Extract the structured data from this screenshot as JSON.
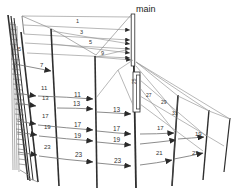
{
  "diagram": {
    "title_label": "main",
    "kind": "uml-sequence-diagram-fisheye",
    "background_color": "#ffffff",
    "line_color": "#3c3c3c",
    "thin_line_color": "#8a8a8a",
    "label_color": "#333333"
  },
  "root_lifeline": {
    "name": "main",
    "label": "main",
    "x_top": 131,
    "y_top": 14
  },
  "messages": [
    {
      "id": "m1",
      "label": "1",
      "x": 76,
      "y": 23
    },
    {
      "id": "m3",
      "label": "3",
      "x": 80,
      "y": 33
    },
    {
      "id": "m5",
      "label": "5",
      "x": 89,
      "y": 43
    },
    {
      "id": "m5b",
      "label": "5",
      "x": 19,
      "y": 50
    },
    {
      "id": "m7",
      "label": "7",
      "x": 41,
      "y": 68
    },
    {
      "id": "m9",
      "label": "9",
      "x": 101,
      "y": 54
    },
    {
      "id": "m11",
      "label": "11",
      "x": 44,
      "y": 90
    },
    {
      "id": "m11b",
      "label": "11",
      "x": 78,
      "y": 96
    },
    {
      "id": "m13",
      "label": "13",
      "x": 46,
      "y": 100
    },
    {
      "id": "m13b",
      "label": "13",
      "x": 76,
      "y": 107
    },
    {
      "id": "m13c",
      "label": "13",
      "x": 118,
      "y": 112
    },
    {
      "id": "m17",
      "label": "17",
      "x": 45,
      "y": 118
    },
    {
      "id": "m17b",
      "label": "17",
      "x": 78,
      "y": 128
    },
    {
      "id": "m17c",
      "label": "17",
      "x": 117,
      "y": 132
    },
    {
      "id": "m17d",
      "label": "17",
      "x": 161,
      "y": 131
    },
    {
      "id": "m19",
      "label": "19",
      "x": 47,
      "y": 130
    },
    {
      "id": "m19b",
      "label": "19",
      "x": 78,
      "y": 139
    },
    {
      "id": "m19c",
      "label": "19",
      "x": 117,
      "y": 143
    },
    {
      "id": "m19d",
      "label": "19",
      "x": 199,
      "y": 136
    },
    {
      "id": "m21",
      "label": "21",
      "x": 160,
      "y": 155
    },
    {
      "id": "m23",
      "label": "23",
      "x": 47,
      "y": 150
    },
    {
      "id": "m23b",
      "label": "23",
      "x": 79,
      "y": 157
    },
    {
      "id": "m23c",
      "label": "23",
      "x": 118,
      "y": 163
    },
    {
      "id": "m23d",
      "label": "23",
      "x": 196,
      "y": 155
    },
    {
      "id": "m25",
      "label": "25",
      "x": 138,
      "y": 84
    },
    {
      "id": "m27",
      "label": "27",
      "x": 150,
      "y": 97
    },
    {
      "id": "m29",
      "label": "29",
      "x": 165,
      "y": 104
    },
    {
      "id": "m31",
      "label": "31",
      "x": 176,
      "y": 115
    }
  ],
  "lifelines": [
    {
      "id": "ll-main",
      "name": "main",
      "x_top": 131,
      "y_top": 14,
      "x_bot": 135,
      "y_bot": 188
    },
    {
      "id": "ll-1",
      "name": "object-1",
      "x_top": 8,
      "y_top": 15,
      "x_bot": 28,
      "y_bot": 180
    },
    {
      "id": "ll-2",
      "name": "object-2",
      "x_top": 10,
      "y_top": 18,
      "x_bot": 30,
      "y_bot": 180
    },
    {
      "id": "ll-3",
      "name": "object-3",
      "x_top": 12,
      "y_top": 21,
      "x_bot": 32,
      "y_bot": 180
    },
    {
      "id": "ll-4",
      "name": "object-4",
      "x_top": 21,
      "y_top": 32,
      "x_bot": 38,
      "y_bot": 182
    },
    {
      "id": "ll-5",
      "name": "object-5",
      "x_top": 51,
      "y_top": 29,
      "x_bot": 59,
      "y_bot": 186
    },
    {
      "id": "ll-6",
      "name": "object-6",
      "x_top": 95,
      "y_top": 56,
      "x_bot": 97,
      "y_bot": 188
    },
    {
      "id": "ll-7",
      "name": "object-7",
      "x_top": 133,
      "y_top": 57,
      "x_bot": 136,
      "y_bot": 188
    },
    {
      "id": "ll-8",
      "name": "object-8",
      "x_top": 178,
      "y_top": 95,
      "x_bot": 172,
      "y_bot": 186
    },
    {
      "id": "ll-9",
      "name": "object-9",
      "x_top": 209,
      "y_top": 110,
      "x_bot": 203,
      "y_bot": 180
    },
    {
      "id": "ll-10",
      "name": "object-10",
      "x_top": 229,
      "y_top": 118,
      "x_bot": 223,
      "y_bot": 172
    }
  ],
  "activations": [
    {
      "id": "act-main-top",
      "x": 131,
      "y": 14,
      "w": 4,
      "h": 52
    },
    {
      "id": "act-mid",
      "x": 133,
      "y": 72,
      "w": 7,
      "h": 40
    },
    {
      "id": "act-mid-2",
      "x": 137,
      "y": 74,
      "w": 4,
      "h": 36
    }
  ]
}
